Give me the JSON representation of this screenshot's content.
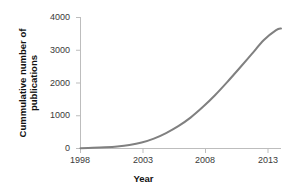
{
  "chart_data": {
    "type": "line",
    "title": "",
    "xlabel": "Year",
    "ylabel": "Cummulative number of publications",
    "xlim": [
      1998,
      2014.4
    ],
    "ylim": [
      0,
      4000
    ],
    "grid": false,
    "legend": null,
    "line_color": "#808080",
    "axis_color": "#b5b5b5",
    "x_ticks": [
      1998,
      2003,
      2008,
      2013
    ],
    "x_tick_labels": [
      "1998",
      "2003",
      "2008",
      "2013"
    ],
    "y_ticks": [
      0,
      1000,
      2000,
      3000,
      4000
    ],
    "y_tick_labels": [
      "0",
      "1000",
      "2000",
      "3000",
      "4000"
    ],
    "series": [
      {
        "name": "Cummulative publications",
        "x": [
          1998,
          1999,
          2000,
          2001,
          2002,
          2003,
          2004,
          2005,
          2006,
          2007,
          2008,
          2009,
          2010,
          2011,
          2012,
          2013,
          2014,
          2014.4
        ],
        "values": [
          10,
          20,
          35,
          60,
          105,
          180,
          300,
          470,
          680,
          940,
          1260,
          1620,
          2020,
          2440,
          2870,
          3300,
          3600,
          3650
        ]
      }
    ]
  },
  "axis_titles": {
    "y_line1": "Cummulative number of",
    "y_line2": "publications",
    "x": "Year"
  },
  "ticks": {
    "y": [
      "4000",
      "3000",
      "2000",
      "1000",
      "0"
    ],
    "x": [
      "1998",
      "2003",
      "2008",
      "2013"
    ]
  }
}
